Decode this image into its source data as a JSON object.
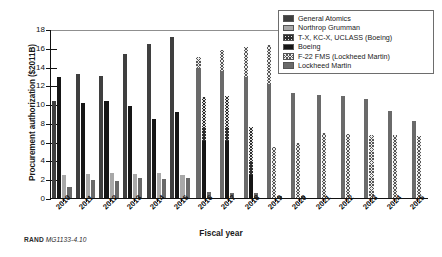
{
  "chart_data": {
    "type": "bar",
    "title": "",
    "xlabel": "Fiscal year",
    "ylabel": "Procurement authorization ($2011B)",
    "ylim": [
      0,
      18
    ],
    "ytick_step": 2,
    "yticks": [
      0,
      2,
      4,
      6,
      8,
      10,
      12,
      14,
      16,
      18
    ],
    "grid": true,
    "legend_position": "top-right",
    "categories": [
      "2010",
      "2011",
      "2012",
      "2013",
      "2014",
      "2015",
      "2016",
      "2017",
      "2018",
      "2019",
      "2020",
      "2021",
      "2022",
      "2023",
      "2024",
      "2025"
    ],
    "series": [
      {
        "name": "General Atomics",
        "color": "#3f3f3f",
        "pattern": "solid",
        "values": [
          10.3,
          null,
          null,
          null,
          null,
          null,
          null,
          null,
          null,
          null,
          null,
          null,
          null,
          null,
          null,
          null
        ]
      },
      {
        "name": "Northrop Grumman",
        "color": "#a8a8a8",
        "pattern": "solid",
        "values": [
          2.4,
          2.55,
          2.65,
          2.6,
          2.7,
          2.5,
          null,
          null,
          null,
          null,
          null,
          null,
          null,
          null,
          null,
          null
        ]
      },
      {
        "name": "T-X, KC-X, UCLASS (Boeing)",
        "color": "#e9e9e9",
        "pattern": "crosshatch-dark",
        "values": [
          null,
          null,
          null,
          null,
          null,
          null,
          4.2,
          4.8,
          5.2,
          null,
          null,
          null,
          null,
          null,
          null,
          null
        ],
        "stacked_on": "Boeing"
      },
      {
        "name": "Boeing",
        "color": "#161616",
        "pattern": "solid",
        "values": [
          12.9,
          10.15,
          10.3,
          9.85,
          8.4,
          9.15,
          6.1,
          6.05,
          2.5,
          null,
          null,
          null,
          null,
          null,
          null,
          null
        ]
      },
      {
        "name": "F-22 FMS (Lockheed Martin)",
        "color": "#ededed",
        "pattern": "crosshatch-light",
        "values": [
          null,
          null,
          null,
          null,
          null,
          null,
          1.2,
          2.25,
          5.05,
          4.1,
          5.85,
          6.9,
          6.8,
          6.75,
          6.7,
          6.65
        ],
        "stacked_on": "Lockheed Martin"
      },
      {
        "name": "Lockheed Martin",
        "color": "#6a6a6a",
        "pattern": "solid",
        "values": [
          1.2,
          1.95,
          1.85,
          2.15,
          2.05,
          2.15,
          13.85,
          13.5,
          12.9,
          12.15,
          0.25,
          null,
          null,
          null,
          null,
          null
        ]
      }
    ],
    "stacks": {
      "note": "Boeing bars carry a T-X/KC-X/UCLASS hatched top segment from 2016-2018; Lockheed Martin bars carry an F-22 FMS hatched top segment from 2016-2025.",
      "boeing_totals": [
        12.9,
        10.15,
        10.3,
        9.85,
        8.4,
        9.15,
        10.8,
        10.85,
        7.55,
        null,
        null,
        null,
        null,
        null,
        null,
        null
      ],
      "lockheed_totals": [
        1.2,
        1.95,
        1.85,
        2.15,
        2.05,
        2.15,
        15.05,
        15.75,
        16.1,
        16.25,
        6.1,
        6.9,
        6.8,
        6.75,
        6.7,
        6.65
      ]
    },
    "groups": [
      {
        "year": "2010",
        "bars": [
          {
            "series": "General Atomics",
            "total": 10.3,
            "segments": [
              {
                "series": "General Atomics",
                "value": 10.3
              }
            ]
          },
          {
            "series": "Boeing",
            "total": 12.9,
            "segments": [
              {
                "series": "Boeing",
                "value": 12.9
              }
            ]
          },
          {
            "series": "Northrop Grumman",
            "total": 2.4,
            "segments": [
              {
                "series": "Northrop Grumman",
                "value": 2.4
              }
            ]
          },
          {
            "series": "Lockheed Martin",
            "total": 1.2,
            "segments": [
              {
                "series": "Lockheed Martin",
                "value": 1.2
              }
            ]
          }
        ]
      },
      {
        "year": "2011",
        "bars": [
          {
            "series": "General Atomics",
            "total": 13.2,
            "segments": [
              {
                "series": "General Atomics",
                "value": 13.2
              }
            ]
          },
          {
            "series": "Boeing",
            "total": 10.15,
            "segments": [
              {
                "series": "Boeing",
                "value": 10.15
              }
            ]
          },
          {
            "series": "Northrop Grumman",
            "total": 2.55,
            "segments": [
              {
                "series": "Northrop Grumman",
                "value": 2.55
              }
            ]
          },
          {
            "series": "Lockheed Martin",
            "total": 1.95,
            "segments": [
              {
                "series": "Lockheed Martin",
                "value": 1.95
              }
            ]
          }
        ]
      },
      {
        "year": "2012",
        "bars": [
          {
            "series": "General Atomics",
            "total": 12.95,
            "segments": [
              {
                "series": "General Atomics",
                "value": 12.95
              }
            ]
          },
          {
            "series": "Boeing",
            "total": 10.3,
            "segments": [
              {
                "series": "Boeing",
                "value": 10.3
              }
            ]
          },
          {
            "series": "Northrop Grumman",
            "total": 2.65,
            "segments": [
              {
                "series": "Northrop Grumman",
                "value": 2.65
              }
            ]
          },
          {
            "series": "Lockheed Martin",
            "total": 1.85,
            "segments": [
              {
                "series": "Lockheed Martin",
                "value": 1.85
              }
            ]
          }
        ]
      },
      {
        "year": "2013",
        "bars": [
          {
            "series": "General Atomics",
            "total": 15.3,
            "segments": [
              {
                "series": "General Atomics",
                "value": 15.3
              }
            ]
          },
          {
            "series": "Boeing",
            "total": 9.85,
            "segments": [
              {
                "series": "Boeing",
                "value": 9.85
              }
            ]
          },
          {
            "series": "Northrop Grumman",
            "total": 2.6,
            "segments": [
              {
                "series": "Northrop Grumman",
                "value": 2.6
              }
            ]
          },
          {
            "series": "Lockheed Martin",
            "total": 2.15,
            "segments": [
              {
                "series": "Lockheed Martin",
                "value": 2.15
              }
            ]
          }
        ]
      },
      {
        "year": "2014",
        "bars": [
          {
            "series": "General Atomics",
            "total": 16.4,
            "segments": [
              {
                "series": "General Atomics",
                "value": 16.4
              }
            ]
          },
          {
            "series": "Boeing",
            "total": 8.4,
            "segments": [
              {
                "series": "Boeing",
                "value": 8.4
              }
            ]
          },
          {
            "series": "Northrop Grumman",
            "total": 2.7,
            "segments": [
              {
                "series": "Northrop Grumman",
                "value": 2.7
              }
            ]
          },
          {
            "series": "Lockheed Martin",
            "total": 2.05,
            "segments": [
              {
                "series": "Lockheed Martin",
                "value": 2.05
              }
            ]
          }
        ]
      },
      {
        "year": "2015",
        "bars": [
          {
            "series": "General Atomics",
            "total": 17.15,
            "segments": [
              {
                "series": "General Atomics",
                "value": 17.15
              }
            ]
          },
          {
            "series": "Boeing",
            "total": 9.15,
            "segments": [
              {
                "series": "Boeing",
                "value": 9.15
              }
            ]
          },
          {
            "series": "Northrop Grumman",
            "total": 2.5,
            "segments": [
              {
                "series": "Northrop Grumman",
                "value": 2.5
              }
            ]
          },
          {
            "series": "Lockheed Martin",
            "total": 2.15,
            "segments": [
              {
                "series": "Lockheed Martin",
                "value": 2.15
              }
            ]
          }
        ]
      },
      {
        "year": "2016",
        "bars": [
          {
            "series": "Lockheed Martin",
            "total": 15.05,
            "segments": [
              {
                "series": "Lockheed Martin",
                "value": 13.85
              },
              {
                "series": "F-22 FMS (Lockheed Martin)",
                "value": 1.2
              }
            ]
          },
          {
            "series": "Boeing",
            "total": 10.8,
            "segments": [
              {
                "series": "Boeing",
                "value": 6.1
              },
              {
                "series": "T-X, KC-X, UCLASS (Boeing)",
                "value": 4.7
              }
            ]
          },
          {
            "series": "Lockheed Martin",
            "total": 0.65,
            "segments": [
              {
                "series": "Lockheed Martin",
                "value": 0.65
              }
            ]
          }
        ]
      },
      {
        "year": "2017",
        "bars": [
          {
            "series": "Lockheed Martin",
            "total": 15.75,
            "segments": [
              {
                "series": "Lockheed Martin",
                "value": 13.5
              },
              {
                "series": "F-22 FMS (Lockheed Martin)",
                "value": 2.25
              }
            ]
          },
          {
            "series": "Boeing",
            "total": 10.85,
            "segments": [
              {
                "series": "Boeing",
                "value": 6.05
              },
              {
                "series": "T-X, KC-X, UCLASS (Boeing)",
                "value": 4.8
              }
            ]
          },
          {
            "series": "Lockheed Martin",
            "total": 0.55,
            "segments": [
              {
                "series": "Lockheed Martin",
                "value": 0.55
              }
            ]
          }
        ]
      },
      {
        "year": "2018",
        "bars": [
          {
            "series": "Lockheed Martin",
            "total": 16.1,
            "segments": [
              {
                "series": "Lockheed Martin",
                "value": 12.9
              },
              {
                "series": "F-22 FMS (Lockheed Martin)",
                "value": 3.2
              }
            ]
          },
          {
            "series": "Boeing",
            "total": 7.55,
            "segments": [
              {
                "series": "Boeing",
                "value": 2.5
              },
              {
                "series": "T-X, KC-X, UCLASS (Boeing)",
                "value": 5.05
              }
            ]
          },
          {
            "series": "Lockheed Martin",
            "total": 0.55,
            "segments": [
              {
                "series": "Lockheed Martin",
                "value": 0.55
              }
            ]
          }
        ]
      },
      {
        "year": "2019",
        "bars": [
          {
            "series": "Lockheed Martin",
            "total": 16.25,
            "segments": [
              {
                "series": "Lockheed Martin",
                "value": 12.15
              },
              {
                "series": "F-22 FMS (Lockheed Martin)",
                "value": 4.1
              }
            ]
          },
          {
            "series": "F-22 FMS (Lockheed Martin)",
            "total": 5.45,
            "segments": [
              {
                "series": "F-22 FMS (Lockheed Martin)",
                "value": 5.45
              }
            ]
          },
          {
            "series": "Lockheed Martin",
            "total": 0.2,
            "segments": [
              {
                "series": "Lockheed Martin",
                "value": 0.2
              }
            ]
          }
        ]
      },
      {
        "year": "2020",
        "bars": [
          {
            "series": "Lockheed Martin",
            "total": 11.2,
            "segments": [
              {
                "series": "Lockheed Martin",
                "value": 11.2
              }
            ]
          },
          {
            "series": "F-22 FMS (Lockheed Martin)",
            "total": 5.85,
            "segments": [
              {
                "series": "F-22 FMS (Lockheed Martin)",
                "value": 5.85
              }
            ]
          },
          {
            "series": "Lockheed Martin",
            "total": 0.25,
            "segments": [
              {
                "series": "Lockheed Martin",
                "value": 0.25
              }
            ]
          }
        ]
      },
      {
        "year": "2021",
        "bars": [
          {
            "series": "Lockheed Martin",
            "total": 10.95,
            "segments": [
              {
                "series": "Lockheed Martin",
                "value": 10.95
              }
            ]
          },
          {
            "series": "F-22 FMS (Lockheed Martin)",
            "total": 6.9,
            "segments": [
              {
                "series": "F-22 FMS (Lockheed Martin)",
                "value": 6.9
              }
            ]
          }
        ]
      },
      {
        "year": "2022",
        "bars": [
          {
            "series": "Lockheed Martin",
            "total": 10.85,
            "segments": [
              {
                "series": "Lockheed Martin",
                "value": 10.85
              }
            ]
          },
          {
            "series": "F-22 FMS (Lockheed Martin)",
            "total": 6.8,
            "segments": [
              {
                "series": "F-22 FMS (Lockheed Martin)",
                "value": 6.8
              }
            ]
          }
        ]
      },
      {
        "year": "2023",
        "bars": [
          {
            "series": "Lockheed Martin",
            "total": 10.5,
            "segments": [
              {
                "series": "Lockheed Martin",
                "value": 10.5
              }
            ]
          },
          {
            "series": "F-22 FMS (Lockheed Martin)",
            "total": 6.75,
            "segments": [
              {
                "series": "F-22 FMS (Lockheed Martin)",
                "value": 6.75
              }
            ]
          }
        ]
      },
      {
        "year": "2024",
        "bars": [
          {
            "series": "Lockheed Martin",
            "total": 9.3,
            "segments": [
              {
                "series": "Lockheed Martin",
                "value": 9.3
              }
            ]
          },
          {
            "series": "F-22 FMS (Lockheed Martin)",
            "total": 6.7,
            "segments": [
              {
                "series": "F-22 FMS (Lockheed Martin)",
                "value": 6.7
              }
            ]
          }
        ]
      },
      {
        "year": "2025",
        "bars": [
          {
            "series": "Lockheed Martin",
            "total": 8.2,
            "segments": [
              {
                "series": "Lockheed Martin",
                "value": 8.2
              }
            ]
          },
          {
            "series": "F-22 FMS (Lockheed Martin)",
            "total": 6.65,
            "segments": [
              {
                "series": "F-22 FMS (Lockheed Martin)",
                "value": 6.65
              }
            ]
          }
        ]
      }
    ]
  },
  "legend": {
    "items": [
      {
        "label": "General Atomics",
        "fill_class": "f-ga"
      },
      {
        "label": "Northrop Grumman",
        "fill_class": "f-ng"
      },
      {
        "label": "T-X, KC-X, UCLASS (Boeing)",
        "fill_class": "f-txkc"
      },
      {
        "label": "Boeing",
        "fill_class": "f-boeing"
      },
      {
        "label": "F-22 FMS (Lockheed Martin)",
        "fill_class": "f-f22"
      },
      {
        "label": "Lockheed Martin",
        "fill_class": "f-lm"
      }
    ]
  },
  "footer": {
    "org": "RAND",
    "doc_id": "MG1133-4.10"
  }
}
